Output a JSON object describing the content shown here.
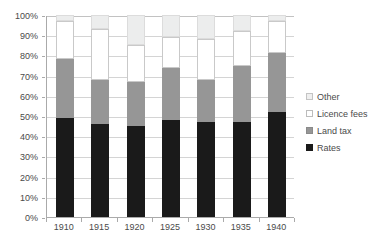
{
  "chart_data": {
    "type": "bar",
    "stacked": true,
    "title": "",
    "subtitle": "",
    "xlabel": "",
    "ylabel": "",
    "categories": [
      "1910",
      "1915",
      "1920",
      "1925",
      "1930",
      "1935",
      "1940"
    ],
    "series": [
      {
        "name": "Rates",
        "color": "#1a1a1a",
        "values": [
          49,
          46,
          45,
          48,
          47,
          47,
          52
        ]
      },
      {
        "name": "Land tax",
        "color": "#969696",
        "values": [
          29,
          22,
          22,
          26,
          21,
          28,
          29
        ]
      },
      {
        "name": "Licence fees",
        "color": "#ffffff",
        "values": [
          19,
          25,
          18,
          15,
          20,
          17,
          16
        ]
      },
      {
        "name": "Other",
        "color": "#eceded",
        "values": [
          3,
          7,
          15,
          11,
          12,
          8,
          3
        ]
      }
    ],
    "legend_entries": [
      "Other",
      "Licence fees",
      "Land tax",
      "Rates"
    ],
    "legend_position": "right",
    "ylim": [
      0,
      100
    ],
    "ytick_labels": [
      "100%",
      "90%",
      "80%",
      "70%",
      "60%",
      "50%",
      "40%",
      "30%",
      "20%",
      "10%",
      "0%"
    ],
    "ytick_values": [
      100,
      90,
      80,
      70,
      60,
      50,
      40,
      30,
      20,
      10,
      0
    ],
    "grid": true,
    "units": "percent"
  },
  "legend": {
    "items": [
      {
        "label": "Other",
        "swatch": "other"
      },
      {
        "label": "Licence fees",
        "swatch": "licence"
      },
      {
        "label": "Land tax",
        "swatch": "landtax"
      },
      {
        "label": "Rates",
        "swatch": "rates"
      }
    ]
  }
}
